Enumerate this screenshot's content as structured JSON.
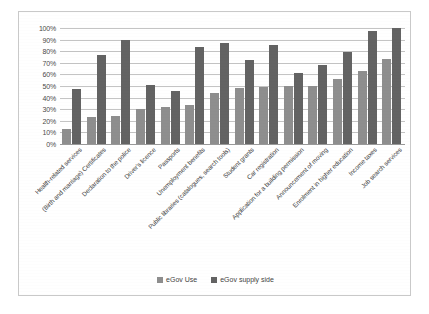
{
  "chart_data": {
    "type": "bar",
    "title": "",
    "subtitle": "",
    "xlabel": "",
    "ylabel": "",
    "ylim": [
      0,
      100
    ],
    "grid": true,
    "legend_position": "bottom",
    "y_tick_labels": [
      "100%",
      "90%",
      "80%",
      "70%",
      "60%",
      "50%",
      "40%",
      "30%",
      "20%",
      "10%",
      "0%"
    ],
    "y_tick_values": [
      100,
      90,
      80,
      70,
      60,
      50,
      40,
      30,
      20,
      10,
      0
    ],
    "categories": [
      "Health-related services",
      "(Birth and marriage) Certificates",
      "Declaration to the police",
      "Driver's licence",
      "Passports",
      "Unemployment benefits",
      "Public libraries (catalogues, search tools)",
      "Student grants",
      "Car registration",
      "Application for a building permission",
      "Announcement of moving",
      "Enrolment in higher education",
      "Income taxes",
      "Job search services"
    ],
    "series": [
      {
        "name": "eGov Use",
        "color": "#8e8e8e",
        "values": [
          13,
          23,
          24,
          30,
          32,
          34,
          44,
          48,
          49,
          50,
          50,
          56,
          63,
          73
        ]
      },
      {
        "name": "eGov supply side",
        "color": "#636363",
        "values": [
          47,
          77,
          90,
          51,
          46,
          84,
          87,
          72,
          85,
          61,
          68,
          79,
          97,
          100
        ]
      }
    ]
  },
  "legend": {
    "items": [
      {
        "label": "eGov Use",
        "swatch": "use"
      },
      {
        "label": "eGov supply side",
        "swatch": "supply"
      }
    ]
  }
}
